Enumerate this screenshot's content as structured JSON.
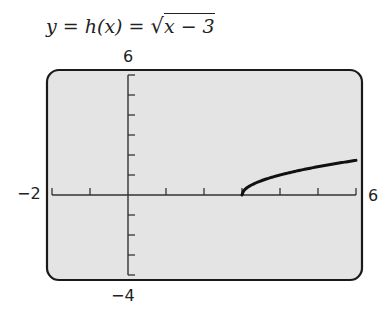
{
  "title": {
    "lhs": "y",
    "eq1": " = ",
    "mid": "h(x)",
    "eq2": " = ",
    "radicand": "x − 3"
  },
  "window_labels": {
    "ymax": "6",
    "ymin": "−4",
    "xmin": "−2",
    "xmax": "6"
  },
  "colors": {
    "screen_bg": "#e4e4e4",
    "frame": "#1a1a1a",
    "axis": "#333333",
    "curve": "#111111"
  },
  "chart_data": {
    "type": "line",
    "xlabel": "",
    "ylabel": "",
    "xlim": [
      -2,
      6
    ],
    "ylim": [
      -4,
      6
    ],
    "x_ticks_step": 1,
    "y_ticks_step": 1,
    "grid": false,
    "legend": null,
    "series": [
      {
        "name": "h(x) = sqrt(x - 3)",
        "x": [
          3,
          3.05,
          3.1,
          3.25,
          3.5,
          3.75,
          4,
          4.5,
          5,
          5.5,
          6
        ],
        "y": [
          0,
          0.224,
          0.316,
          0.5,
          0.707,
          0.866,
          1,
          1.225,
          1.414,
          1.581,
          1.732
        ]
      }
    ]
  }
}
